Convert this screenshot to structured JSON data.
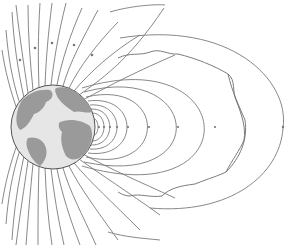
{
  "diagram": {
    "type": "magnetosphere",
    "colors": {
      "background": "#ffffff",
      "field_line": "#7a7a7a",
      "earth_ocean": "#e6e6e6",
      "earth_land": "#9a9a9a",
      "earth_outline": "#555555"
    },
    "earth": {
      "cx": 53,
      "cy": 127,
      "r": 42
    },
    "elements": [
      {
        "name": "earth-globe",
        "label": "Earth"
      },
      {
        "name": "open-field-lines-north",
        "count": 14
      },
      {
        "name": "open-field-lines-south",
        "count": 14
      },
      {
        "name": "closed-field-loops",
        "count": 8
      },
      {
        "name": "magnetopause-boundary",
        "style": "wavy"
      },
      {
        "name": "outer-field-arc"
      }
    ]
  }
}
